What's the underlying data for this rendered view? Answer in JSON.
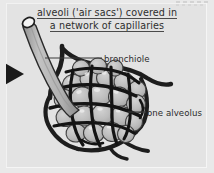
{
  "figure": {
    "title_line_1": "alveoli ('air sacs') covered in",
    "title_line_2": "a network of capillaries",
    "labels": {
      "bronchiole": "bronchiole",
      "one_alveolus": "one alveolus"
    },
    "icons": {
      "pointer_arrow": "left-edge-arrowhead-icon",
      "bronchiole_tube": "bronchiole-tube-icon",
      "alveoli_cluster": "alveoli-cluster-icon",
      "capillary_network": "capillary-network-icon",
      "corner_ticks": "corner-tick-marks-icon"
    },
    "colors": {
      "page_background": "#e9e9e9",
      "panel_background": "#e3e3e3",
      "text": "#2e2e2e",
      "capillary_stroke": "#1d1d1d",
      "alveolus_fill": "#b9b9b9",
      "alveolus_stroke": "#3a3a3a",
      "tube_fill": "#b5b5b5",
      "tube_stroke": "#2a2a2a",
      "tube_opening": "#f2f2f2",
      "leader_line": "#3a3a3a",
      "arrow_fill": "#1a1a1a"
    }
  }
}
